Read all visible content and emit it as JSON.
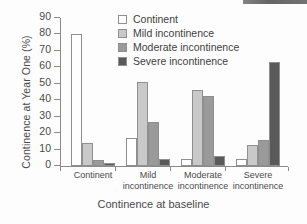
{
  "chart_data": {
    "type": "bar",
    "title": "",
    "xlabel": "Continence at baseline",
    "ylabel": "Continence at Year One (%)",
    "ylim": [
      0,
      90
    ],
    "ytick_values": [
      0,
      10,
      20,
      30,
      40,
      50,
      60,
      70,
      80,
      90
    ],
    "ytick_labels": [
      "0",
      "10",
      "20",
      "30",
      "40",
      "50",
      "60",
      "70",
      "80",
      "90"
    ],
    "grid": false,
    "legend_position": "top-center",
    "categories": [
      "Continent",
      "Mild incontinence",
      "Moderate incontinence",
      "Severe incontinence"
    ],
    "category_label_lines": [
      [
        "Continent"
      ],
      [
        "Mild",
        "incontinence"
      ],
      [
        "Moderate",
        "incontinence"
      ],
      [
        "Severe",
        "incontinence"
      ]
    ],
    "series": [
      {
        "name": "Continent",
        "color": "#ffffff",
        "values": [
          80,
          17,
          4,
          4
        ]
      },
      {
        "name": "Mild incontinence",
        "color": "#c9c9c9",
        "values": [
          14,
          51,
          46.5,
          12.5
        ]
      },
      {
        "name": "Moderate incontinence",
        "color": "#9a9a9a",
        "values": [
          3.5,
          27,
          42.5,
          16
        ]
      },
      {
        "name": "Severe incontinence",
        "color": "#5a5a5a",
        "values": [
          2,
          4.5,
          6,
          63
        ]
      }
    ]
  },
  "axes": {
    "y_title": "Continence at Year One (%)",
    "x_title": "Continence at baseline"
  },
  "legend": {
    "items": [
      {
        "label": "Continent"
      },
      {
        "label": "Mild incontinence"
      },
      {
        "label": "Moderate incontinence"
      },
      {
        "label": "Severe incontinence"
      }
    ]
  }
}
